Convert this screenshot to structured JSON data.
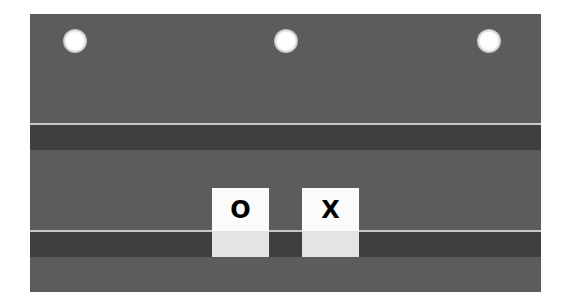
{
  "board": {
    "background_color": "#5c5c5c",
    "rail_band_color": "#3f3f3f",
    "rail_line_color": "#c8c8c8",
    "pegs": [
      {
        "name": "peg-left"
      },
      {
        "name": "peg-middle"
      },
      {
        "name": "peg-right"
      }
    ],
    "tiles": [
      {
        "symbol": "O",
        "face_color": "#fbfbfb",
        "base_color": "#e4e4e4"
      },
      {
        "symbol": "X",
        "face_color": "#fbfbfb",
        "base_color": "#e4e4e4"
      }
    ]
  }
}
